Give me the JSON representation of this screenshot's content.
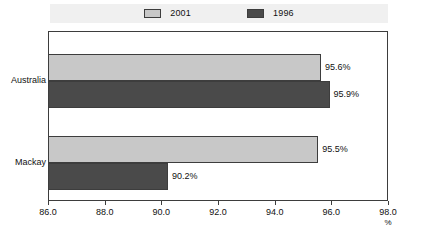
{
  "chart_data": {
    "type": "bar",
    "orientation": "horizontal",
    "title": "",
    "xlabel": "%",
    "ylabel": "",
    "categories": [
      "Australia",
      "Mackay"
    ],
    "series": [
      {
        "name": "2001",
        "color": "#c8c8c8",
        "values": [
          95.6,
          95.5
        ],
        "labels": [
          "95.6%",
          "95.5%"
        ]
      },
      {
        "name": "1996",
        "color": "#4a4a4a",
        "values": [
          95.9,
          90.2
        ],
        "labels": [
          "95.9%",
          "90.2%"
        ]
      }
    ],
    "xlim": [
      86.0,
      98.0
    ],
    "xticks": [
      86.0,
      88.0,
      90.0,
      92.0,
      94.0,
      96.0,
      98.0
    ],
    "xtick_labels": [
      "86.0",
      "88.0",
      "90.0",
      "92.0",
      "94.0",
      "96.0",
      "98.0"
    ],
    "grid": false,
    "legend_position": "top"
  },
  "legend": {
    "entries": [
      {
        "label": "2001",
        "swatch_color": "#c8c8c8"
      },
      {
        "label": "1996",
        "swatch_color": "#4a4a4a"
      }
    ]
  },
  "axis": {
    "unit": "%"
  }
}
